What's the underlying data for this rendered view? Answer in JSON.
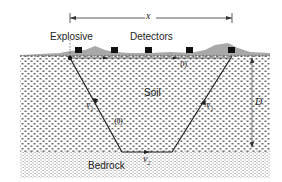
{
  "diagram": {
    "labels": {
      "distance": "x",
      "explosive": "Explosive",
      "detectors": "Detectors",
      "soil": "Soil",
      "bedrock": "Bedrock",
      "depth": "D",
      "path_direct": "(i)",
      "path_refracted": "(ii)",
      "v1_left": "v",
      "v1_left_sub": "1",
      "v1_right": "v",
      "v1_right_sub": "1",
      "v2": "v",
      "v2_sub": "2"
    },
    "detector_count": 5,
    "colors": {
      "soil_dots": "#6a6a6a",
      "bedrock_dots": "#9a9a9a",
      "surface": "#a8a8a8",
      "ray": "#222222",
      "detector": "#111111"
    }
  }
}
